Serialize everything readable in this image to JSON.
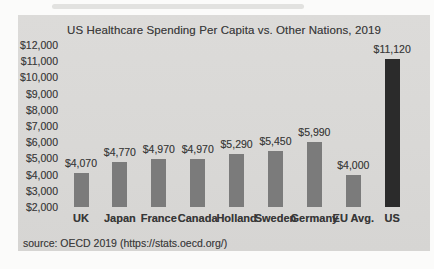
{
  "page": {
    "background": "#fbfbfa",
    "scan_block_bg": "#d9d8d6"
  },
  "chart_data": {
    "type": "bar",
    "title": "US Healthcare Spending Per Capita vs. Other Nations, 2019",
    "source": "source: OECD 2019 (https://stats.oecd.org/)",
    "categories": [
      "UK",
      "Japan",
      "France",
      "Canada",
      "Holland",
      "Sweden",
      "Germany",
      "EU Avg.",
      "US"
    ],
    "values": [
      4070,
      4770,
      4970,
      4970,
      5290,
      5450,
      5990,
      4000,
      11120
    ],
    "data_labels": [
      "$4,070",
      "$4,770",
      "$4,970",
      "$4,970",
      "$5,290",
      "$5,450",
      "$5,990",
      "$4,000",
      "$11,120"
    ],
    "xlabel": "",
    "ylabel": "",
    "ylim": [
      2000,
      12000
    ],
    "ytick_step": 1000,
    "yticks": [
      {
        "value": 12000,
        "label": "$12,000"
      },
      {
        "value": 11000,
        "label": "$11,000"
      },
      {
        "value": 10000,
        "label": "$10,000"
      },
      {
        "value": 9000,
        "label": "$9,000"
      },
      {
        "value": 8000,
        "label": "$8,000"
      },
      {
        "value": 7000,
        "label": "$7,000"
      },
      {
        "value": 6000,
        "label": "$6,000"
      },
      {
        "value": 5000,
        "label": "$5,000"
      },
      {
        "value": 4000,
        "label": "$4,000"
      },
      {
        "value": 3000,
        "label": "$3,000"
      },
      {
        "value": 2000,
        "label": "$2,000"
      }
    ],
    "grid": false,
    "legend": "none",
    "bar_color": "#7b7b7b",
    "highlight_index": 8,
    "highlight_color": "#2b2b2b"
  }
}
